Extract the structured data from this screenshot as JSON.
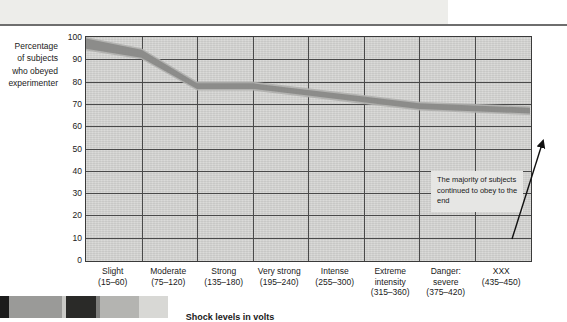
{
  "chart_data": {
    "type": "area",
    "title": "",
    "subtitle": "",
    "xlabel": "Shock levels in volts",
    "ylabel": "Percentage of subjects who obeyed experimenter",
    "ylim": [
      0,
      100
    ],
    "yticks": [
      100,
      90,
      80,
      70,
      60,
      50,
      40,
      30,
      20,
      10,
      0
    ],
    "grid": true,
    "legend": "none",
    "band_style": "shaded band showing range of obedience",
    "categories": [
      "Slight (15–60)",
      "Moderate (75–120)",
      "Strong (135–180)",
      "Very strong (195–240)",
      "Intense (255–300)",
      "Extreme intensity (315–360)",
      "Danger: severe (375–420)",
      "XXX (435–450)"
    ],
    "series": [
      {
        "name": "upper bound",
        "values": [
          100,
          95,
          80,
          80,
          77,
          74,
          71,
          69
        ]
      },
      {
        "name": "lower bound",
        "values": [
          94,
          90,
          76,
          76,
          73,
          70,
          67,
          65
        ]
      }
    ],
    "annotations": [
      {
        "text": "The majority of subjects continued to obey to the end",
        "points_to": "XXX (435–450)"
      }
    ]
  },
  "axes": {
    "y_label_lines": [
      "Percentage",
      "of subjects",
      "who obeyed",
      "experimenter"
    ],
    "y_ticks": [
      "100",
      "90",
      "80",
      "70",
      "60",
      "50",
      "40",
      "30",
      "20",
      "10",
      "0"
    ],
    "x_title": "Shock levels in volts",
    "x_categories": [
      {
        "name": "Slight",
        "range": "(15–60)"
      },
      {
        "name": "Moderate",
        "range": "(75–120)"
      },
      {
        "name": "Strong",
        "range": "(135–180)"
      },
      {
        "name": "Very strong",
        "range": "(195–240)"
      },
      {
        "name": "Intense",
        "range": "(255–300)"
      },
      {
        "name": "Extreme intensity",
        "range": "(315–360)"
      },
      {
        "name": "Danger: severe",
        "range": "(375–420)"
      },
      {
        "name": "XXX",
        "range": "(435–450)"
      }
    ]
  },
  "annotation": {
    "text": "The majority of subjects continued to obey to the end"
  },
  "colors": {
    "plot_background": "#d4d4d2",
    "band_dark": "#8a8a88",
    "band_light": "#b0b0ae",
    "grid": "#4a4a4a",
    "frame": "#3a3a3a",
    "annotation_background": "#e6e6e4",
    "text": "#1a1a1a"
  }
}
